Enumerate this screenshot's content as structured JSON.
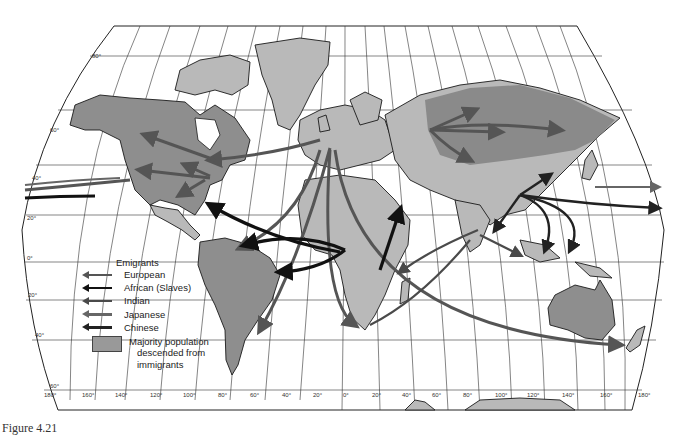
{
  "map": {
    "subject": "Global migration of emigrants",
    "latitude_labels": [
      "80°",
      "60°",
      "40°",
      "20°",
      "0°",
      "20°",
      "40°",
      "60°"
    ],
    "longitude_labels": [
      "180°",
      "160°",
      "140°",
      "120°",
      "100°",
      "80°",
      "60°",
      "40°",
      "20°",
      "0°",
      "20°",
      "40°",
      "60°",
      "80°",
      "100°",
      "120°",
      "140°",
      "160°",
      "180°"
    ],
    "colors": {
      "land": "#b9b9b9",
      "majority_immigrant_population": "#8e8e8e",
      "european_arrow": "#555555",
      "african_arrow": "#111111",
      "indian_arrow": "#4a4a4a",
      "japanese_arrow": "#666666",
      "chinese_arrow": "#222222"
    }
  },
  "legend": {
    "title": "Emigrants",
    "items": [
      {
        "label": "European",
        "color": "#555555"
      },
      {
        "label": "African (Slaves)",
        "color": "#111111"
      },
      {
        "label": "Indian",
        "color": "#4a4a4a"
      },
      {
        "label": "Japanese",
        "color": "#666666"
      },
      {
        "label": "Chinese",
        "color": "#222222"
      }
    ],
    "area_label_lines": [
      "Majority population",
      "descended from",
      "immigrants"
    ],
    "area_color": "#999999"
  },
  "caption": "Figure 4.21"
}
